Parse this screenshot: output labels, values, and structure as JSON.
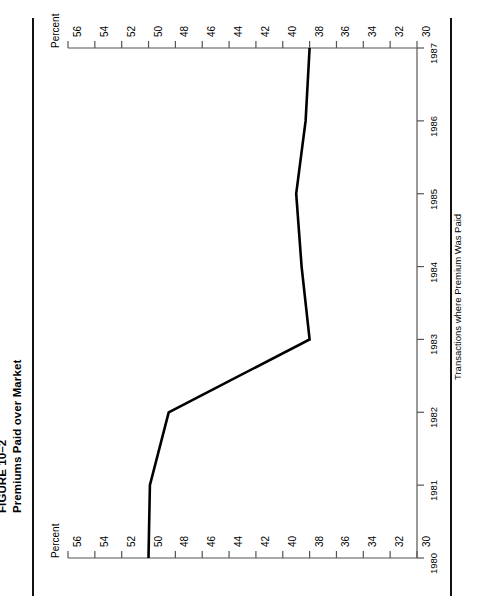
{
  "figure": {
    "number": "FIGURE 10–2",
    "title": "Premiums Paid over Market"
  },
  "chart_data": {
    "type": "line",
    "title": "Premiums Paid over Market",
    "subtitle": "FIGURE 10–2",
    "orientation": "rotated-90",
    "xlabel": "Transactions where Premium Was Paid",
    "ylabel": "Percent",
    "value_axis_caption_top": "Percent",
    "value_axis_caption_bottom": "Percent",
    "categories": [
      "1980",
      "1981",
      "1982",
      "1983",
      "1984",
      "1985",
      "1986",
      "1987"
    ],
    "values": [
      50,
      49.9,
      48.5,
      38,
      38.6,
      39,
      38.3,
      38
    ],
    "value_ticks": [
      56,
      54,
      52,
      50,
      48,
      46,
      44,
      42,
      40,
      38,
      36,
      34,
      32,
      30
    ],
    "value_range": [
      56,
      30
    ],
    "value_axis_reversed": true,
    "grid": false,
    "legend": null,
    "series": [
      {
        "name": "Premium paid over market",
        "points": [
          {
            "year": "1980",
            "value": 50
          },
          {
            "year": "1981",
            "value": 49.9
          },
          {
            "year": "1982",
            "value": 48.5
          },
          {
            "year": "1983",
            "value": 38
          },
          {
            "year": "1984",
            "value": 38.6
          },
          {
            "year": "1985",
            "value": 39
          },
          {
            "year": "1986",
            "value": 38.3
          },
          {
            "year": "1987",
            "value": 38
          }
        ]
      }
    ],
    "line_color": "#000000",
    "axis_color": "#555555"
  }
}
